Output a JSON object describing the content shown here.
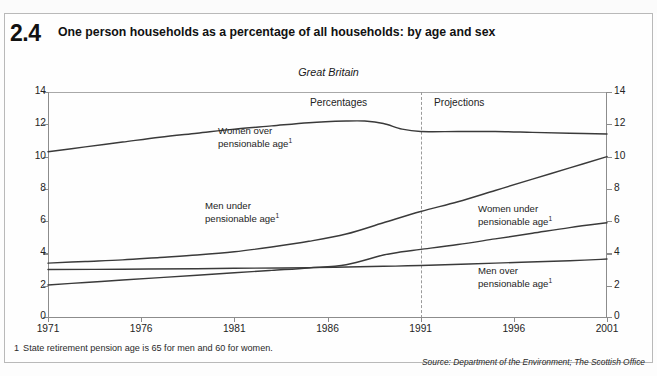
{
  "figure": {
    "number": "2.4",
    "title": "One person households as a percentage of all households: by age and sex",
    "region": "Great Britain",
    "footnote_marker": "1",
    "footnote_text": "State retirement pension age is 65 for men and 60 for women.",
    "source": "Source: Department of the Environment; The Scottish Office"
  },
  "zones": {
    "historic_label": "Percentages",
    "projection_label": "Projections",
    "divider_year": 1991
  },
  "colors": {
    "line": "#3a3a3a",
    "axis": "#8c8c8c",
    "text": "#242424",
    "frame": "#b9b9b9"
  },
  "chart_data": {
    "type": "line",
    "title": "One person households as a percentage of all households: by age and sex",
    "subtitle": "Great Britain",
    "xlabel": "",
    "ylabel": "Percentages",
    "xlim": [
      1971,
      2001
    ],
    "ylim": [
      0,
      14
    ],
    "xticks": [
      1971,
      1976,
      1981,
      1986,
      1991,
      1996,
      2001
    ],
    "yticks": [
      0,
      2,
      4,
      6,
      8,
      10,
      12,
      14
    ],
    "grid": false,
    "legend": "inline-annotations",
    "annotations": [
      {
        "text": "Percentages",
        "x": 1986,
        "y": 13.3
      },
      {
        "text": "Projections",
        "x": 1993,
        "y": 13.3
      },
      {
        "text": "Great Britain",
        "x": 1990,
        "y": 14.9
      }
    ],
    "series": [
      {
        "name": "Women over pensionable age ¹",
        "label_lines": [
          "Women over",
          "pensionable age"
        ],
        "x": [
          1971,
          1973,
          1975,
          1977,
          1979,
          1981,
          1983,
          1985,
          1987,
          1988,
          1989,
          1990,
          1991,
          1993,
          1995,
          1997,
          1999,
          2001
        ],
        "values": [
          10.3,
          10.6,
          10.9,
          11.2,
          11.45,
          11.7,
          11.9,
          12.1,
          12.2,
          12.2,
          12.05,
          11.7,
          11.55,
          11.55,
          11.55,
          11.5,
          11.45,
          11.4
        ]
      },
      {
        "name": "Men under pensionable age ¹",
        "label_lines": [
          "Men under",
          "pensionable age"
        ],
        "x": [
          1971,
          1973,
          1975,
          1977,
          1979,
          1981,
          1983,
          1985,
          1987,
          1989,
          1991,
          1993,
          1995,
          1997,
          1999,
          2001
        ],
        "values": [
          3.4,
          3.5,
          3.6,
          3.75,
          3.9,
          4.1,
          4.4,
          4.75,
          5.2,
          5.9,
          6.6,
          7.2,
          7.9,
          8.6,
          9.3,
          10.0
        ]
      },
      {
        "name": "Women under pensionable age ¹",
        "label_lines": [
          "Women under",
          "pensionable age"
        ],
        "x": [
          1971,
          1973,
          1975,
          1977,
          1979,
          1981,
          1983,
          1985,
          1987,
          1989,
          1990,
          1991,
          1993,
          1995,
          1997,
          1999,
          2001
        ],
        "values": [
          2.05,
          2.2,
          2.35,
          2.5,
          2.65,
          2.8,
          2.95,
          3.1,
          3.3,
          3.9,
          4.1,
          4.25,
          4.55,
          4.9,
          5.25,
          5.6,
          5.9
        ]
      },
      {
        "name": "Men over pensionable age ¹",
        "label_lines": [
          "Men over",
          "pensionable age"
        ],
        "x": [
          1971,
          1975,
          1979,
          1981,
          1985,
          1989,
          1991,
          1995,
          1999,
          2001
        ],
        "values": [
          3.0,
          3.02,
          3.05,
          3.08,
          3.12,
          3.2,
          3.25,
          3.4,
          3.55,
          3.65
        ]
      }
    ]
  },
  "axis": {
    "y_labels_left": [
      "14",
      "12",
      "10",
      "8",
      "6",
      "4",
      "2",
      "0"
    ],
    "y_labels_right": [
      "14",
      "12",
      "10",
      "8",
      "6",
      "4",
      "2",
      "0"
    ],
    "x_labels": [
      "1971",
      "1976",
      "1981",
      "1986",
      "1991",
      "1996",
      "2001"
    ]
  },
  "series_labels": [
    {
      "key": "women_over",
      "line1": "Women over",
      "line2": "pensionable age",
      "sup": "1",
      "left": 218,
      "top": 126
    },
    {
      "key": "men_under",
      "line1": "Men under",
      "line2": "pensionable age",
      "sup": "1",
      "left": 204,
      "top": 201
    },
    {
      "key": "women_under",
      "line1": "Women under",
      "line2": "pensionable age",
      "sup": "1",
      "left": 478,
      "top": 204
    },
    {
      "key": "men_over",
      "line1": "Men over",
      "line2": "pensionable age",
      "sup": "1",
      "left": 478,
      "top": 266
    }
  ]
}
